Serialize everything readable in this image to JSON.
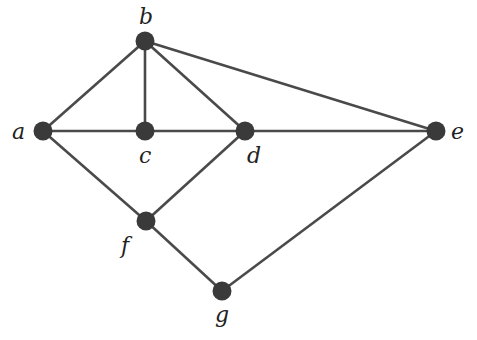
{
  "graph": {
    "nodes": [
      {
        "id": "a",
        "label": "a",
        "x": 43,
        "y": 131,
        "lx": 12,
        "ly": 139
      },
      {
        "id": "b",
        "label": "b",
        "x": 145,
        "y": 41,
        "lx": 139,
        "ly": 24
      },
      {
        "id": "c",
        "label": "c",
        "x": 145,
        "y": 131,
        "lx": 139,
        "ly": 163
      },
      {
        "id": "d",
        "label": "d",
        "x": 245,
        "y": 131,
        "lx": 247,
        "ly": 163
      },
      {
        "id": "e",
        "label": "e",
        "x": 436,
        "y": 131,
        "lx": 451,
        "ly": 139
      },
      {
        "id": "f",
        "label": "f",
        "x": 146,
        "y": 221,
        "lx": 121,
        "ly": 253
      },
      {
        "id": "g",
        "label": "g",
        "x": 222,
        "y": 291,
        "lx": 215,
        "ly": 322
      }
    ],
    "edges": [
      [
        "a",
        "b"
      ],
      [
        "a",
        "c"
      ],
      [
        "a",
        "f"
      ],
      [
        "b",
        "c"
      ],
      [
        "b",
        "d"
      ],
      [
        "b",
        "e"
      ],
      [
        "c",
        "d"
      ],
      [
        "d",
        "e"
      ],
      [
        "d",
        "f"
      ],
      [
        "f",
        "g"
      ],
      [
        "g",
        "e"
      ]
    ],
    "colors": {
      "edge": "#4a4a4a",
      "node": "#3a3a3a",
      "label": "#222222"
    }
  }
}
